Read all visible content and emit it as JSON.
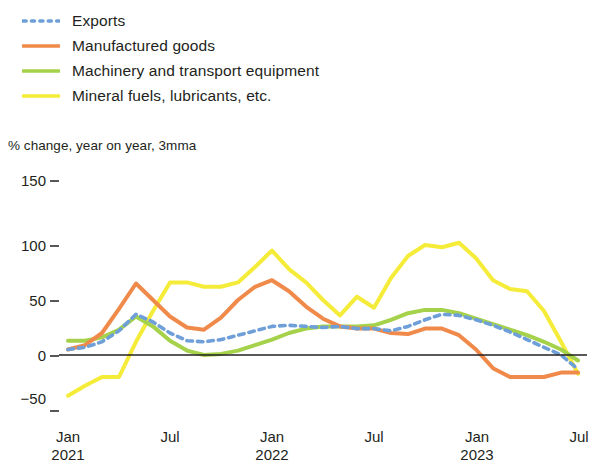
{
  "legend": {
    "items": [
      {
        "label": "Exports",
        "color": "#6f9fd8",
        "style": "dotted",
        "name": "legend-item-exports"
      },
      {
        "label": "Manufactured goods",
        "color": "#f08a4b",
        "style": "solid",
        "name": "legend-item-manufactured-goods"
      },
      {
        "label": "Machinery and transport equipment",
        "color": "#a5d24a",
        "style": "solid",
        "name": "legend-item-machinery-transport"
      },
      {
        "label": "Mineral fuels, lubricants, etc.",
        "color": "#f5ec3a",
        "style": "solid",
        "name": "legend-item-mineral-fuels"
      }
    ]
  },
  "axis": {
    "subtitle": "% change, year on year, 3mma",
    "y_ticks": [
      "150",
      "100",
      "50",
      "0",
      "−50"
    ],
    "x_ticks": [
      {
        "month": "Jan",
        "year": "2021"
      },
      {
        "month": "Jul",
        "year": ""
      },
      {
        "month": "Jan",
        "year": "2022"
      },
      {
        "month": "Jul",
        "year": ""
      },
      {
        "month": "Jan",
        "year": "2023"
      },
      {
        "month": "Jul",
        "year": ""
      }
    ]
  },
  "chart_data": {
    "type": "line",
    "title": "",
    "subtitle": "% change, year on year, 3mma",
    "xlabel": "",
    "ylabel": "% change, year on year, 3mma",
    "ylim": [
      -50,
      150
    ],
    "yticks": [
      -50,
      0,
      50,
      100,
      150
    ],
    "grid": false,
    "legend_position": "top-left",
    "x": [
      "2021-01",
      "2021-02",
      "2021-03",
      "2021-04",
      "2021-05",
      "2021-06",
      "2021-07",
      "2021-08",
      "2021-09",
      "2021-10",
      "2021-11",
      "2021-12",
      "2022-01",
      "2022-02",
      "2022-03",
      "2022-04",
      "2022-05",
      "2022-06",
      "2022-07",
      "2022-08",
      "2022-09",
      "2022-10",
      "2022-11",
      "2022-12",
      "2023-01",
      "2023-02",
      "2023-03",
      "2023-04",
      "2023-05",
      "2023-06",
      "2023-07"
    ],
    "x_tick_labels": [
      "Jan 2021",
      "Jul",
      "Jan 2022",
      "Jul",
      "Jan 2023",
      "Jul"
    ],
    "series": [
      {
        "name": "Exports",
        "color": "#6f9fd8",
        "style": "dotted",
        "values": [
          5,
          7,
          12,
          22,
          37,
          30,
          20,
          13,
          12,
          14,
          18,
          22,
          26,
          27,
          26,
          25,
          26,
          24,
          24,
          22,
          26,
          32,
          37,
          36,
          32,
          27,
          21,
          14,
          7,
          0,
          -13
        ]
      },
      {
        "name": "Manufactured goods",
        "color": "#f08a4b",
        "style": "solid",
        "values": [
          5,
          9,
          20,
          42,
          65,
          50,
          35,
          25,
          23,
          34,
          50,
          62,
          68,
          58,
          44,
          33,
          26,
          24,
          24,
          20,
          19,
          24,
          24,
          18,
          5,
          -12,
          -20,
          -20,
          -20,
          -16,
          -16
        ]
      },
      {
        "name": "Machinery and transport equipment",
        "color": "#a5d24a",
        "style": "solid",
        "values": [
          13,
          13,
          16,
          23,
          35,
          26,
          13,
          4,
          0,
          1,
          4,
          9,
          14,
          20,
          24,
          26,
          26,
          26,
          27,
          32,
          38,
          41,
          41,
          38,
          33,
          28,
          23,
          18,
          12,
          5,
          -5
        ]
      },
      {
        "name": "Mineral fuels, lubricants, etc.",
        "color": "#f5ec3a",
        "style": "solid",
        "values": [
          -37,
          -28,
          -20,
          -20,
          12,
          40,
          66,
          66,
          62,
          62,
          66,
          80,
          95,
          78,
          66,
          50,
          36,
          53,
          43,
          70,
          90,
          100,
          98,
          102,
          88,
          68,
          60,
          58,
          40,
          12,
          -17
        ]
      }
    ],
    "zero_line": true
  }
}
